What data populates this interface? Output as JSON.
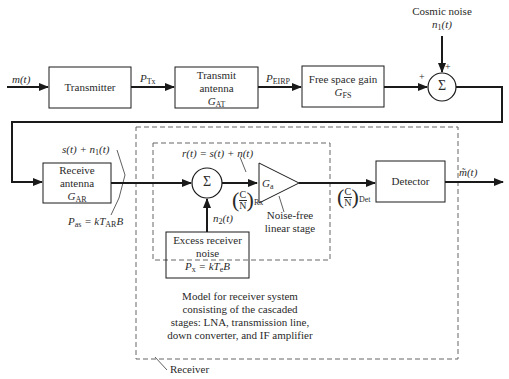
{
  "diagram": {
    "inputs": {
      "message": "m(t)"
    },
    "blocks": {
      "transmitter": {
        "label": "Transmitter"
      },
      "transmit_antenna": {
        "line1": "Transmit",
        "line2": "antenna",
        "gain_sym": "G",
        "gain_sub": "AT"
      },
      "free_space": {
        "line1": "Free space gain",
        "gain_sym": "G",
        "gain_sub": "FS"
      },
      "receive_antenna": {
        "line1": "Receive",
        "line2": "antenna",
        "gain_sym": "G",
        "gain_sub": "AR"
      },
      "excess_noise": {
        "line1": "Excess receiver",
        "line2": "noise",
        "eq": "Px = kTeB"
      },
      "amplifier": {
        "sym": "G",
        "sub": "a"
      },
      "detector": {
        "label": "Detector"
      }
    },
    "signals": {
      "p_tx": "P_Tx",
      "p_eirp": "P_EIRP",
      "cosmic_noise_title": "Cosmic noise",
      "cosmic_noise_sym": "n1(t)",
      "received": "s(t) + n1(t)",
      "p_as": "Pas = kTARB",
      "r_t": "r(t) = s(t) + n(t)",
      "n2": "n2(t)",
      "cn_rx": "(C/N)Rx",
      "cn_det": "(C/N)Det",
      "output": "m̃(t)"
    },
    "annotations": {
      "noise_free": [
        "Noise-free",
        "linear stage"
      ],
      "model": [
        "Model for receiver system",
        "consisting of the cascaded",
        "stages: LNA, transmission line,",
        "down converter, and IF amplifier"
      ],
      "receiver": "Receiver"
    },
    "summers": {
      "symbol": "Σ",
      "plus": "+"
    }
  }
}
